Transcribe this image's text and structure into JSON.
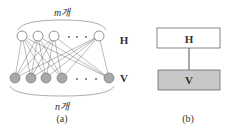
{
  "panel_a": {
    "top_label": "m개",
    "bottom_label": "n개",
    "caption": "(a)",
    "top_dots": "· · ·",
    "bottom_dots": "· · ·"
  },
  "panel_b": {
    "hidden_layer_side_label": "H",
    "visible_layer_side_label": "V",
    "hidden_box_label": "H",
    "visible_box_label": "V",
    "caption": "(b)"
  },
  "colors": {
    "hidden_node_fill": "#ffffff",
    "visible_node_fill": "#a8a8a8",
    "visible_box_fill": "#c8c8c8",
    "line": "#555555"
  }
}
